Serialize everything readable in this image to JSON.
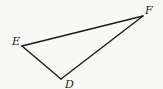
{
  "diagram": {
    "type": "triangle",
    "vertices": [
      {
        "name": "E",
        "x": 22,
        "y": 46,
        "label_x": 12,
        "label_y": 45
      },
      {
        "name": "F",
        "x": 143,
        "y": 16,
        "label_x": 144,
        "label_y": 14
      },
      {
        "name": "D",
        "x": 61,
        "y": 79,
        "label_x": 65,
        "label_y": 88
      }
    ],
    "edges": [
      [
        "E",
        "F"
      ],
      [
        "F",
        "D"
      ],
      [
        "D",
        "E"
      ]
    ],
    "labels": {
      "E": "E",
      "F": "F",
      "D": "D"
    },
    "colors": {
      "line": "#1a1a1a",
      "background": "#f8f8f6",
      "text": "#222222"
    }
  }
}
